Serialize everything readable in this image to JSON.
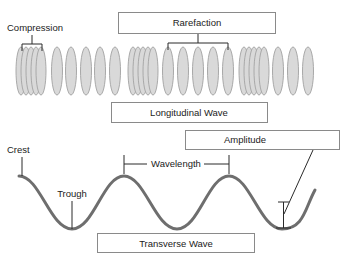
{
  "diagram": {
    "longitudinal": {
      "caption": "Longitudinal Wave",
      "labels": {
        "compression": "Compression",
        "rarefaction": "Rarefaction"
      },
      "colors": {
        "fill": "#d9d9d9",
        "stroke": "#a9a9a9"
      },
      "groups": [
        {
          "type": "compression",
          "centers": [
            21,
            26,
            31,
            36,
            41
          ]
        },
        {
          "type": "rarefaction",
          "centers": [
            57,
            71,
            86,
            100,
            115
          ]
        },
        {
          "type": "compression",
          "centers": [
            133,
            138,
            143,
            148,
            153
          ]
        },
        {
          "type": "rarefaction",
          "centers": [
            168,
            183,
            198,
            213,
            228
          ]
        },
        {
          "type": "compression",
          "centers": [
            244,
            249,
            254,
            259,
            264
          ]
        },
        {
          "type": "rarefaction",
          "centers": [
            278,
            293,
            308
          ]
        }
      ]
    },
    "transverse": {
      "caption": "Transverse Wave",
      "labels": {
        "crest": "Crest",
        "trough": "Trough",
        "wavelength": "Wavelength",
        "amplitude": "Amplitude"
      },
      "colors": {
        "wave": "#6e6e6e"
      }
    }
  }
}
